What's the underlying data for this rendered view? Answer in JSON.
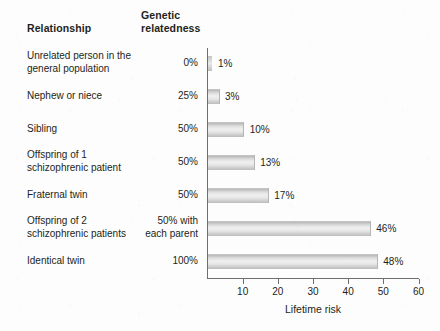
{
  "headers": {
    "relationship": "Relationship",
    "relatedness": "Genetic\nrelatedness"
  },
  "axis": {
    "x_title": "Lifetime risk",
    "ticks": [
      10,
      20,
      30,
      40,
      50,
      60
    ],
    "tick_labels": [
      "10",
      "20",
      "30",
      "40",
      "50",
      "60"
    ]
  },
  "rows": [
    {
      "relationship": "Unrelated person in the\ngeneral population",
      "relatedness": "0%",
      "value": 1,
      "value_label": "1%"
    },
    {
      "relationship": "Nephew or niece",
      "relatedness": "25%",
      "value": 3,
      "value_label": "3%"
    },
    {
      "relationship": "Sibling",
      "relatedness": "50%",
      "value": 10,
      "value_label": "10%"
    },
    {
      "relationship": "Offspring of 1\nschizophrenic patient",
      "relatedness": "50%",
      "value": 13,
      "value_label": "13%"
    },
    {
      "relationship": "Fraternal twin",
      "relatedness": "50%",
      "value": 17,
      "value_label": "17%"
    },
    {
      "relationship": "Offspring of 2\nschizophrenic patients",
      "relatedness": "50% with\neach parent",
      "value": 46,
      "value_label": "46%"
    },
    {
      "relationship": "Identical twin",
      "relatedness": "100%",
      "value": 48,
      "value_label": "48%"
    }
  ],
  "chart_data": {
    "type": "bar",
    "orientation": "horizontal",
    "title": "",
    "xlabel": "Lifetime risk",
    "ylabel": "",
    "xlim": [
      0,
      60
    ],
    "xticks": [
      10,
      20,
      30,
      40,
      50,
      60
    ],
    "grid": false,
    "legend": false,
    "categories": [
      "Unrelated person in the general population",
      "Nephew or niece",
      "Sibling",
      "Offspring of 1 schizophrenic patient",
      "Fraternal twin",
      "Offspring of 2 schizophrenic patients",
      "Identical twin"
    ],
    "values": [
      1,
      3,
      10,
      13,
      17,
      46,
      48
    ],
    "data_labels": [
      "1%",
      "3%",
      "10%",
      "13%",
      "17%",
      "46%",
      "48%"
    ],
    "annotations": {
      "genetic_relatedness": [
        "0%",
        "25%",
        "50%",
        "50%",
        "50%",
        "50% with each parent",
        "100%"
      ]
    },
    "colors": {
      "bar_fill": "#e6e6e6",
      "bar_edge": "#bcbcbc",
      "axis": "#6e6e6e",
      "text": "#231f20"
    }
  }
}
